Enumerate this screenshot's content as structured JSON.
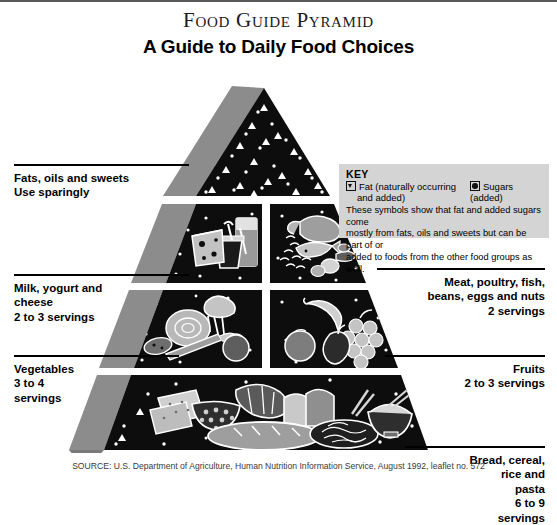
{
  "title": {
    "main": "Food Guide Pyramid",
    "subtitle": "A Guide to Daily Food Choices"
  },
  "key": {
    "heading": "KEY",
    "fat_label": "Fat (naturally occurring",
    "fat_label_2": "and added)",
    "sugars_label": "Sugars (added)",
    "note_line1": "These symbols show that fat and added sugars come",
    "note_line2": "mostly from fats, oils and sweets but can be part of or",
    "note_line3": "added to foods from the other food groups as well.",
    "fat_symbol": "open-triangle-icon",
    "sugar_symbol": "filled-circle-icon",
    "background_color": "#d4d4d4"
  },
  "groups": [
    {
      "id": "fats",
      "name_line1": "Fats, oils and sweets",
      "name_line2": "Use sparingly",
      "side": "left",
      "foods": [
        "fat symbols",
        "sugar symbols"
      ]
    },
    {
      "id": "milk",
      "name_line1": "Milk, yogurt and",
      "name_line2": "cheese",
      "servings": "2 to 3 servings",
      "side": "left",
      "foods": [
        "cheese wedge",
        "milk glass",
        "yogurt cup"
      ]
    },
    {
      "id": "meat",
      "name_line1": "Meat, poultry, fish,",
      "name_line2": "beans, eggs and nuts",
      "servings": "2 servings",
      "side": "right",
      "foods": [
        "steak",
        "poultry",
        "fish",
        "beans",
        "eggs",
        "nuts"
      ]
    },
    {
      "id": "vegetables",
      "name_line1": "Vegetables",
      "servings_line1": "3 to 4",
      "servings_line2": "servings",
      "side": "left",
      "foods": [
        "lettuce",
        "broccoli",
        "carrot",
        "potato",
        "tomato"
      ]
    },
    {
      "id": "fruits",
      "name_line1": "Fruits",
      "servings": "2 to 3 servings",
      "side": "right",
      "foods": [
        "banana",
        "orange",
        "apple",
        "grapes"
      ]
    },
    {
      "id": "bread",
      "name_line1": "Bread, cereal,",
      "name_line2": "rice and",
      "name_line3": "pasta",
      "servings_line1": "6 to 9",
      "servings_line2": "servings",
      "side": "right",
      "foods": [
        "crackers",
        "cereal bowl",
        "croissant",
        "bread slices",
        "bread loaf",
        "pasta",
        "rice bowl"
      ]
    }
  ],
  "source": "SOURCE: U.S. Department of Agriculture, Human Nutrition Information Service, August 1992, leaflet no. 572",
  "colors": {
    "pyramid_face": "#0d0d0d",
    "pyramid_side": "#8c8c8c",
    "food_art": "#bdbdbd",
    "food_art_dark": "#6e6e6e",
    "divider": "#ffffff"
  }
}
